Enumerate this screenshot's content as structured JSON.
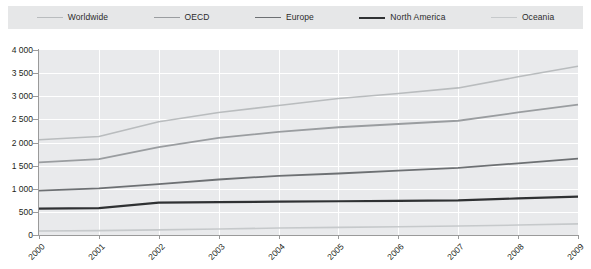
{
  "legend": {
    "position": "top",
    "items": [
      {
        "label": "Worldwide",
        "color": "#b9bcbe",
        "width": 1.6
      },
      {
        "label": "OECD",
        "color": "#9a9da0",
        "width": 1.8
      },
      {
        "label": "Europe",
        "color": "#6d7073",
        "width": 1.8
      },
      {
        "label": "North America",
        "color": "#2f3133",
        "width": 2.2
      },
      {
        "label": "Oceania",
        "color": "#c6c9cb",
        "width": 1.6
      }
    ]
  },
  "axes": {
    "y_ticks": [
      "0",
      "500",
      "1 000",
      "1 500",
      "2 000",
      "2 500",
      "3 000",
      "3 500",
      "4 000"
    ],
    "x_ticks": [
      "2000",
      "2001",
      "2002",
      "2003",
      "2004",
      "2005",
      "2006",
      "2007",
      "2008",
      "2009"
    ]
  },
  "colors": {
    "legend_background": "#e6e7e8",
    "plot_background": "#e9eaec",
    "gridline": "#ffffff",
    "axis": "#9a9a9a",
    "text": "#231f20"
  },
  "chart_data": {
    "type": "line",
    "title": "",
    "subtitle": "",
    "xlabel": "",
    "ylabel": "",
    "x": [
      "2000",
      "2001",
      "2002",
      "2003",
      "2004",
      "2005",
      "2006",
      "2007",
      "2008",
      "2009"
    ],
    "xlim": [
      "2000",
      "2009"
    ],
    "ylim": [
      0,
      4000
    ],
    "ytick_values": [
      0,
      500,
      1000,
      1500,
      2000,
      2500,
      3000,
      3500,
      4000
    ],
    "grid": "horizontal-and-vertical",
    "legend_position": "top",
    "series": [
      {
        "name": "Worldwide",
        "color": "#b9bcbe",
        "values": [
          2060,
          2130,
          2450,
          2650,
          2800,
          2950,
          3060,
          3180,
          3420,
          3650
        ]
      },
      {
        "name": "OECD",
        "color": "#9a9da0",
        "values": [
          1570,
          1640,
          1900,
          2100,
          2230,
          2330,
          2400,
          2470,
          2650,
          2820
        ]
      },
      {
        "name": "Europe",
        "color": "#6d7073",
        "values": [
          960,
          1010,
          1100,
          1200,
          1280,
          1330,
          1390,
          1450,
          1550,
          1650
        ]
      },
      {
        "name": "North America",
        "color": "#2f3133",
        "values": [
          570,
          580,
          700,
          710,
          720,
          730,
          740,
          750,
          790,
          830
        ]
      },
      {
        "name": "Oceania",
        "color": "#c6c9cb",
        "values": [
          85,
          95,
          110,
          130,
          150,
          165,
          180,
          195,
          215,
          240
        ]
      }
    ]
  }
}
